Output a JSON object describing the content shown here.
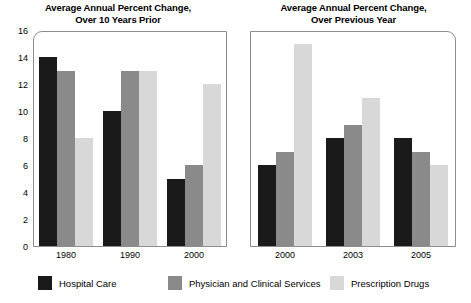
{
  "chart_data": {
    "type": "bar",
    "title": "Average Annual Percent Change",
    "grid": false,
    "legend_position": "bottom",
    "ylim": [
      0,
      16
    ],
    "yticks": [
      0,
      2,
      4,
      6,
      8,
      10,
      12,
      14,
      16
    ],
    "ylabel": "",
    "xlabel": "",
    "series_names": [
      "Hospital Care",
      "Physician and Clinical Services",
      "Prescription Drugs"
    ],
    "series_colors": [
      "#1a1a1a",
      "#8a8a8a",
      "#d8d8d8"
    ],
    "panels": [
      {
        "title": "Average Annual Percent Change,\nOver 10 Years Prior",
        "categories": [
          "1980",
          "1990",
          "2000"
        ],
        "series": [
          {
            "name": "Hospital Care",
            "values": [
              14,
              10,
              5
            ]
          },
          {
            "name": "Physician and Clinical Services",
            "values": [
              13,
              13,
              6
            ]
          },
          {
            "name": "Prescription Drugs",
            "values": [
              8,
              13,
              12
            ]
          }
        ]
      },
      {
        "title": "Average Annual Percent Change,\nOver Previous Year",
        "categories": [
          "2000",
          "2003",
          "2005"
        ],
        "series": [
          {
            "name": "Hospital Care",
            "values": [
              6,
              8,
              8
            ]
          },
          {
            "name": "Physician and Clinical Services",
            "values": [
              7,
              9,
              7
            ]
          },
          {
            "name": "Prescription Drugs",
            "values": [
              15,
              11,
              6
            ]
          }
        ]
      }
    ]
  },
  "legend": {
    "items": [
      {
        "label": "Hospital Care",
        "color": "#1a1a1a",
        "x": 38
      },
      {
        "label": "Physician and Clinical Services",
        "color": "#8a8a8a",
        "x": 168
      },
      {
        "label": "Prescription Drugs",
        "color": "#d8d8d8",
        "x": 330
      }
    ]
  }
}
